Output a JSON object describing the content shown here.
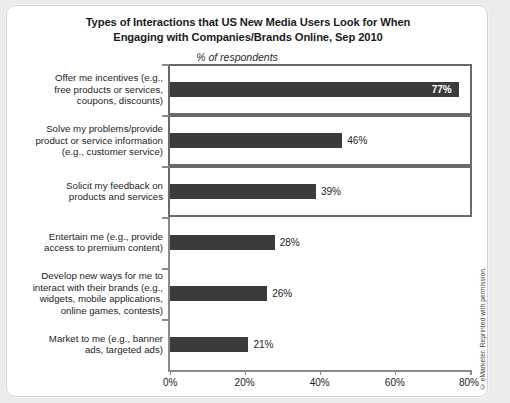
{
  "chart_data": {
    "type": "bar",
    "orientation": "horizontal",
    "title": "Types of Interactions that US New Media Users Look for When Engaging with Companies/Brands Online, Sep 2010",
    "title_lines": [
      "Types of Interactions that US New Media Users Look for When",
      "Engaging with Companies/Brands Online, Sep 2010"
    ],
    "subtitle": "% of respondents",
    "xlabel": "",
    "ylabel": "",
    "xlim": [
      0,
      80
    ],
    "grid": false,
    "legend": null,
    "tick_labels": [
      "0%",
      "20%",
      "40%",
      "60%",
      "80%"
    ],
    "tick_values": [
      0,
      20,
      40,
      60,
      80
    ],
    "bar_color": "#3b3b3b",
    "highlight_box_color": "#6a6a6c",
    "categories": [
      "Offer me incentives (e.g., free products or services, coupons, discounts)",
      "Solve my problems/provide product or service information (e.g., customer service)",
      "Solicit my feedback on products and services",
      "Entertain me (e.g., provide access to premium content)",
      "Develop new ways for me to interact with their brands (e.g., widgets, mobile applications, online games, contests)",
      "Market to me (e.g., banner ads, targeted ads)"
    ],
    "category_lines": [
      [
        "Offer me incentives (e.g.,",
        "free products or services,",
        "coupons, discounts)"
      ],
      [
        "Solve my problems/provide",
        "product or service information",
        "(e.g., customer service)"
      ],
      [
        "Solicit my feedback on",
        "products and services"
      ],
      [
        "Entertain me (e.g., provide",
        "access to premium content)"
      ],
      [
        "Develop new ways for me to",
        "interact with their brands (e.g.,",
        "widgets, mobile applications,",
        "online games, contests)"
      ],
      [
        "Market to me (e.g., banner",
        "ads, targeted ads)"
      ]
    ],
    "values": [
      77,
      46,
      39,
      28,
      26,
      21
    ],
    "value_labels": [
      "77%",
      "46%",
      "39%",
      "28%",
      "26%",
      "21%"
    ],
    "label_placement": [
      "inside",
      "outside",
      "outside",
      "outside",
      "outside",
      "outside"
    ],
    "highlighted": [
      true,
      true,
      true,
      false,
      false,
      false
    ]
  },
  "footer": {
    "copyright": "© eMarketer. Reprinted with permission."
  }
}
